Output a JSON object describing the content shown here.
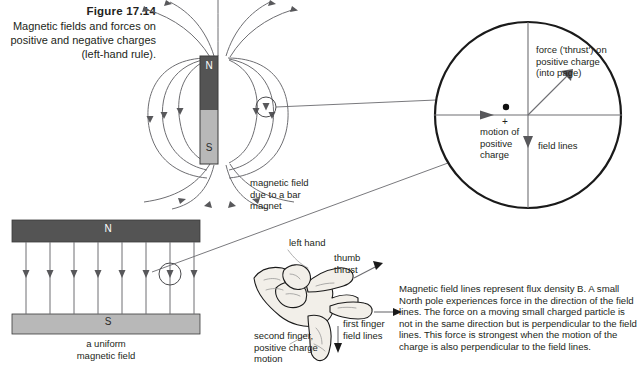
{
  "figure": {
    "number": "Figure 17.14",
    "caption": "Magnetic fields and forces on positive and negative charges (left-hand rule)."
  },
  "bar_magnet": {
    "north_label": "N",
    "south_label": "S",
    "caption_line1": "magnetic field",
    "caption_line2": "due to a bar",
    "caption_line3": "magnet"
  },
  "uniform_field": {
    "north_label": "N",
    "south_label": "S",
    "caption_line1": "a uniform",
    "caption_line2": "magnetic field",
    "field_line_count": 8
  },
  "magnified_circle": {
    "force_label_line1": "force ('thrust') on",
    "force_label_line2": "positive charge",
    "force_label_line3": "(into page)",
    "motion_label_line1": "motion of",
    "motion_label_line2": "positive",
    "motion_label_line3": "charge",
    "charge_sign": "+",
    "field_lines_label": "field lines"
  },
  "left_hand": {
    "title": "left hand",
    "thumb_label_line1": "thumb",
    "thumb_label_line2": "thrust",
    "first_finger_line1": "first finger",
    "first_finger_line2": "field lines",
    "second_finger_line1": "second finger,",
    "second_finger_line2": "positive charge",
    "second_finger_line3": "motion"
  },
  "body_text": "Magnetic field lines represent flux density B. A small North pole experiences force in the direction of the field lines. The force on a moving small charged particle is not in the same direction but is perpendicular to the field lines. This force is strongest when the motion of the charge is also perpendicular to the field lines.",
  "colors": {
    "north_pole": "#545454",
    "south_pole": "#b8b8b8",
    "field_line": "#6e6e72",
    "text": "#231f20",
    "circle_outline": "#1a1a1a"
  }
}
